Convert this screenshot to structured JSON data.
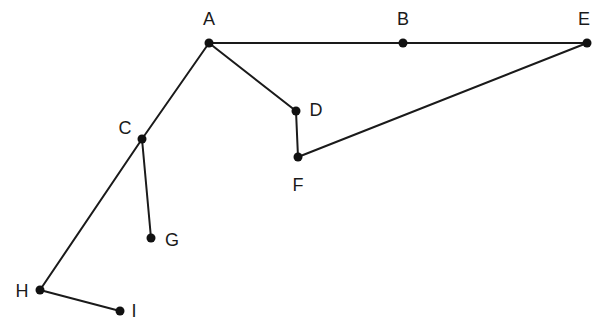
{
  "diagram": {
    "type": "graph",
    "nodes": [
      {
        "id": "A",
        "label": "A"
      },
      {
        "id": "B",
        "label": "B"
      },
      {
        "id": "E",
        "label": "E"
      },
      {
        "id": "D",
        "label": "D"
      },
      {
        "id": "F",
        "label": "F"
      },
      {
        "id": "C",
        "label": "C"
      },
      {
        "id": "G",
        "label": "G"
      },
      {
        "id": "H",
        "label": "H"
      },
      {
        "id": "I",
        "label": "I"
      }
    ],
    "edges": [
      [
        "A",
        "B"
      ],
      [
        "B",
        "E"
      ],
      [
        "A",
        "D"
      ],
      [
        "D",
        "F"
      ],
      [
        "F",
        "E"
      ],
      [
        "A",
        "C"
      ],
      [
        "C",
        "G"
      ],
      [
        "C",
        "H"
      ],
      [
        "H",
        "I"
      ]
    ],
    "colors": {
      "line": "#1a1a1a",
      "node": "#111111",
      "background": "#ffffff"
    }
  }
}
